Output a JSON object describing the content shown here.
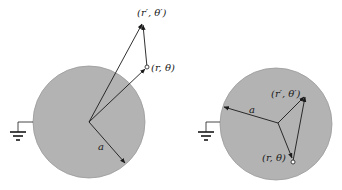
{
  "figure": {
    "colors": {
      "sphere_fill": "#b3b3b3",
      "sphere_stroke": "#8c8c8c",
      "line": "#1a1a1a",
      "background": "#ffffff"
    },
    "left_panel": {
      "description": "Grounded conducting sphere with point charge outside",
      "labels": {
        "source_point": "(r′, θ′)",
        "field_point": "(r, θ)",
        "radius": "a"
      },
      "ground_icon": "ground-icon"
    },
    "right_panel": {
      "description": "Grounded conducting sphere with point charge inside",
      "labels": {
        "source_point": "(r′, θ′)",
        "field_point": "(r, θ)",
        "radius": "a"
      },
      "ground_icon": "ground-icon"
    }
  }
}
